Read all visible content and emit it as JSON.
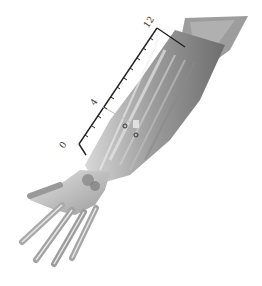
{
  "illustration": {
    "subject": "forearm and hand anatomy (dorsal view, muscles)",
    "ruler": {
      "labels": [
        "0",
        "4",
        "12"
      ],
      "color": "#222222"
    },
    "markers": [
      {
        "name": "acupoint-1"
      },
      {
        "name": "acupoint-2"
      }
    ],
    "colors": {
      "skin_dark": "#7a7a7a",
      "skin_mid": "#a8a8a8",
      "skin_light": "#d6d6d6",
      "background": "#ffffff"
    }
  }
}
